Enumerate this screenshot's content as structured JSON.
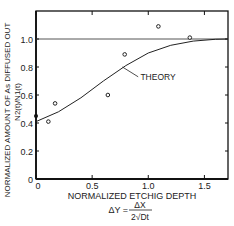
{
  "chart_data": {
    "type": "scatter",
    "title": "",
    "xlabel": "NORMALIZED ETCHIG DEPTH",
    "xlabel_formula": {
      "lhs": "ΔY =",
      "numerator": "ΔX",
      "denominator": "2√Dt"
    },
    "ylabel_line1": "NORMALIZED AMOUNT OF As DIFFUSED OUT",
    "ylabel_line2": "N2(t)/N1(t)",
    "xlim": [
      0,
      1.71
    ],
    "ylim": [
      0,
      1.2
    ],
    "x_ticks": [
      "0",
      "0.5",
      "1.0",
      "1.5"
    ],
    "x_tick_values": [
      0,
      0.5,
      1.0,
      1.5
    ],
    "y_ticks": [
      "0",
      "0.2",
      "0.4",
      "0.6",
      "0.8",
      "1.0"
    ],
    "y_tick_values": [
      0,
      0.2,
      0.4,
      0.6,
      0.8,
      1.0
    ],
    "reference_line": {
      "y": 1.0
    },
    "series": [
      {
        "name": "Experiment",
        "marker": "open-circle",
        "x": [
          0.11,
          0.17,
          0.64,
          0.79,
          1.09,
          1.37
        ],
        "y": [
          0.41,
          0.54,
          0.6,
          0.89,
          1.09,
          1.01
        ]
      },
      {
        "name": "Start point",
        "marker": "filled-circle",
        "x": [
          0
        ],
        "y": [
          0.45
        ]
      },
      {
        "name": "THEORY",
        "marker": "line",
        "x": [
          0,
          0.2,
          0.4,
          0.6,
          0.8,
          1.0,
          1.2,
          1.4,
          1.6,
          1.71
        ],
        "y": [
          0.41,
          0.48,
          0.58,
          0.7,
          0.81,
          0.9,
          0.955,
          0.985,
          0.998,
          1.0
        ]
      }
    ],
    "annotations": [
      {
        "text": "THEORY",
        "x": 0.93,
        "y": 0.71
      }
    ],
    "grid": false,
    "legend": "none"
  }
}
